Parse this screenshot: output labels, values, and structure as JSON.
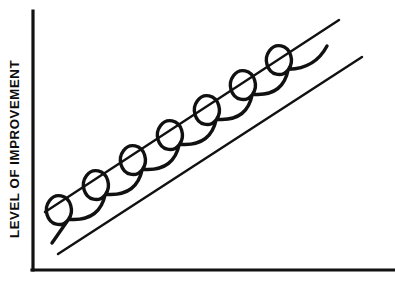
{
  "figure": {
    "name": "level-of-improvement-spiral-trend-diagram",
    "background_color": "#ffffff",
    "ink_color": "#111111",
    "width": 395,
    "height": 286
  },
  "axes": {
    "y_axis_label": "LEVEL OF IMPROVEMENT",
    "x_axis_label": "",
    "y_axis_color": "#111111",
    "x_axis_color": "#111111",
    "tick_labels_x": [],
    "tick_labels_y": [],
    "origin": {
      "x": 32,
      "y": 270
    },
    "y_axis_top": {
      "x": 32,
      "y": 11
    },
    "x_axis_right": {
      "x": 395,
      "y": 270
    }
  },
  "chart_data": {
    "type": "line",
    "title": "",
    "xlabel": "",
    "ylabel": "LEVEL OF IMPROVEMENT",
    "grid": false,
    "legend": null,
    "xlim": [
      0,
      395
    ],
    "ylim": [
      0,
      286
    ],
    "series": [
      {
        "name": "upper-boundary-line",
        "style": "straight-line",
        "points": [
          [
            45,
            212
          ],
          [
            339,
            20
          ]
        ]
      },
      {
        "name": "lower-boundary-line",
        "style": "straight-line",
        "points": [
          [
            58,
            254
          ],
          [
            362,
            57
          ]
        ]
      },
      {
        "name": "looping-progress-curve",
        "style": "spiral-loops",
        "loop_count": 7,
        "start_point": [
          52,
          243
        ],
        "end_point": [
          327,
          46
        ],
        "loop_centers": [
          [
            78,
            228
          ],
          [
            115,
            203
          ],
          [
            152,
            178
          ],
          [
            189,
            153
          ],
          [
            226,
            128
          ],
          [
            262,
            103
          ],
          [
            298,
            78
          ]
        ]
      }
    ]
  },
  "annotations": []
}
